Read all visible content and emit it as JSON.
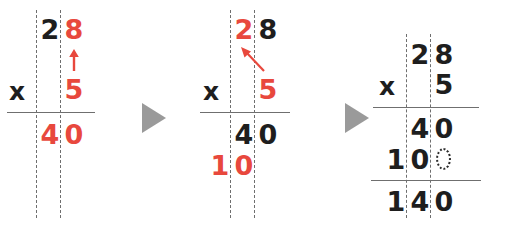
{
  "figure": {
    "operation": "28 x 5",
    "product": "140",
    "accent_red": "#e8483d",
    "ink_black": "#1e1e1e",
    "guide_gray": "#6e6e6e",
    "arrow_gray": "#9a9a9a"
  },
  "steps": [
    {
      "name": "step-1-multiply-ones",
      "multiplicand": {
        "tens": "2",
        "ones": "8"
      },
      "multiplier": "5",
      "operator": "x",
      "partial_rows": [
        {
          "name": "partial-product-ones",
          "tens": "4",
          "ones": "0"
        }
      ],
      "highlighted": [
        "8",
        "5",
        "4",
        "0"
      ],
      "annotation": {
        "type": "arrow-up",
        "label": "multiply-ones-arrow"
      }
    },
    {
      "name": "step-2-multiply-tens",
      "multiplicand": {
        "tens": "2",
        "ones": "8"
      },
      "multiplier": "5",
      "operator": "x",
      "partial_rows": [
        {
          "name": "partial-product-ones",
          "tens": "4",
          "ones": "0"
        },
        {
          "name": "partial-product-tens",
          "hundreds": "1",
          "tens": "0"
        }
      ],
      "highlighted": [
        "2",
        "5",
        "1",
        "0"
      ],
      "annotation": {
        "type": "arrow-diagonal",
        "label": "multiply-tens-arrow"
      }
    },
    {
      "name": "step-3-add-partials",
      "multiplicand": {
        "tens": "2",
        "ones": "8"
      },
      "multiplier": "5",
      "operator": "x",
      "partial_rows": [
        {
          "name": "partial-product-ones",
          "tens": "4",
          "ones": "0"
        },
        {
          "name": "partial-product-tens",
          "hundreds": "1",
          "tens": "0",
          "ones_placeholder": "0"
        }
      ],
      "total": {
        "hundreds": "1",
        "tens": "4",
        "ones": "0"
      },
      "highlighted": []
    }
  ],
  "separators": [
    {
      "name": "step-separator-1",
      "glyph": "triangle-right"
    },
    {
      "name": "step-separator-2",
      "glyph": "triangle-right"
    }
  ]
}
